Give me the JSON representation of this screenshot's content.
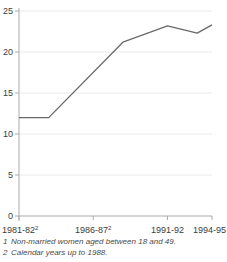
{
  "chart_data": {
    "type": "line",
    "title": "",
    "xlabel": "",
    "ylabel": "",
    "ylim": [
      0,
      25
    ],
    "yticks": [
      0,
      5,
      10,
      15,
      20,
      25
    ],
    "x_range": [
      "1981-82",
      "1994-95"
    ],
    "xticks": [
      {
        "offset": 0,
        "label": "1981-82",
        "sup": "2"
      },
      {
        "offset": 5,
        "label": "1986-87",
        "sup": "2"
      },
      {
        "offset": 10,
        "label": "1991-92",
        "sup": ""
      },
      {
        "offset": 13,
        "label": "1994-95",
        "sup": ""
      }
    ],
    "series": [
      {
        "name": "percentage-line",
        "color": "#696969",
        "points": [
          {
            "x": "1981-82",
            "offset": 0,
            "value": 12
          },
          {
            "x": "1983-84",
            "offset": 2,
            "value": 12
          },
          {
            "x": "1988-89",
            "offset": 7,
            "value": 21.2
          },
          {
            "x": "1991-92",
            "offset": 10,
            "value": 23.2
          },
          {
            "x": "1993-94",
            "offset": 12,
            "value": 22.3
          },
          {
            "x": "1994-95",
            "offset": 13,
            "value": 23.3
          }
        ]
      }
    ],
    "grid": {
      "show": true,
      "color": "#eaeaea"
    },
    "axis_color": "#ababab",
    "legend": {
      "show": false
    }
  },
  "footnotes": [
    {
      "marker": "1",
      "text": "Non-married women aged between 18 and 49."
    },
    {
      "marker": "2",
      "text": "Calendar years up to 1988."
    }
  ]
}
